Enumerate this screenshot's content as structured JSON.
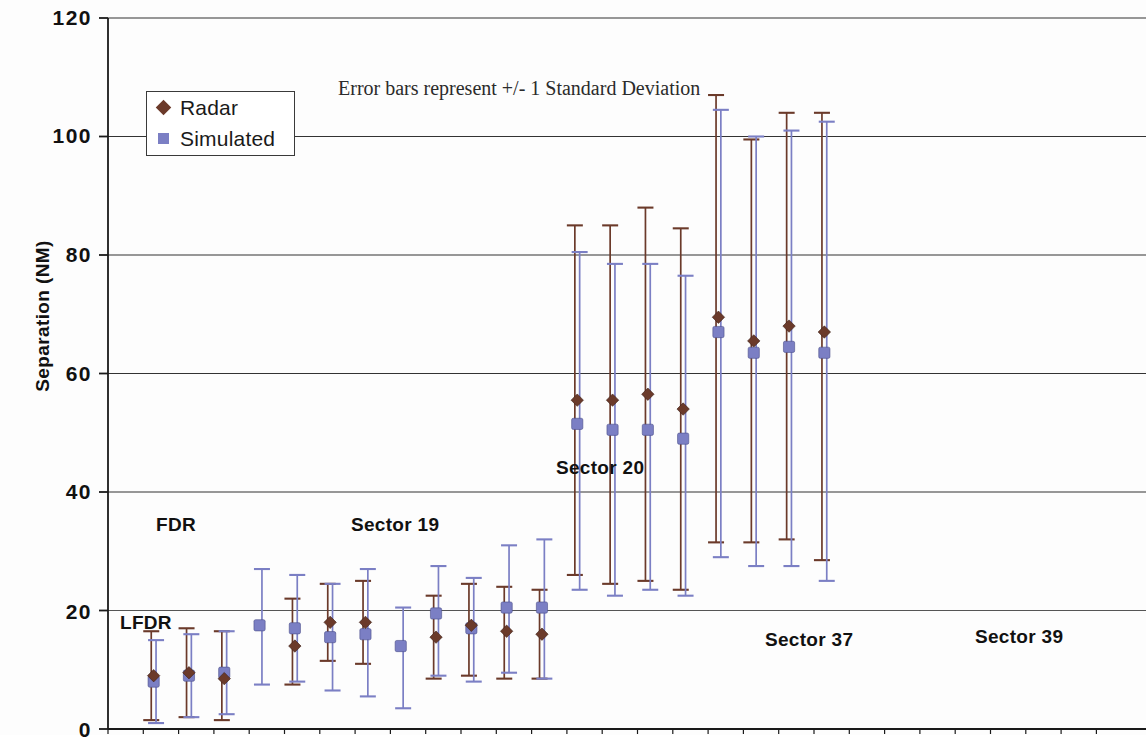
{
  "chart_data": {
    "type": "scatter",
    "title": "",
    "annotation": "Error bars represent +/- 1 Standard Deviation",
    "xlabel": "",
    "ylabel": "Separation (NM)",
    "ylim": [
      0,
      120
    ],
    "yticks": [
      0,
      20,
      40,
      60,
      80,
      100,
      120
    ],
    "grid": "horizontal",
    "legend_position": "upper-left",
    "legend": [
      {
        "name": "Radar",
        "color": "#6B3A2A",
        "marker": "diamond"
      },
      {
        "name": "Simulated",
        "color": "#7B7FC4",
        "marker": "square"
      }
    ],
    "group_labels": [
      {
        "text": "FDR",
        "x_pct": 14.5,
        "y_nm": 32
      },
      {
        "text": "LFDR",
        "x_pct": 12.5,
        "y_nm": 19
      },
      {
        "text": "Sector 19",
        "x_pct": 33.0,
        "y_nm": 32
      },
      {
        "text": "Sector 20",
        "x_pct": 53.0,
        "y_nm": 42
      },
      {
        "text": "Sector 37",
        "x_pct": 74.0,
        "y_nm": 14
      },
      {
        "text": "Sector 39",
        "x_pct": 92.0,
        "y_nm": 14
      }
    ],
    "groups": [
      {
        "name": "FDR",
        "points": [
          {
            "x": 1,
            "radar": 9.0,
            "radar_lo": 1.5,
            "radar_hi": 16.5,
            "sim": 8.0,
            "sim_lo": 1.0,
            "sim_hi": 15.0
          },
          {
            "x": 2,
            "radar": 9.5,
            "radar_lo": 2.0,
            "radar_hi": 17.0,
            "sim": 9.0,
            "sim_lo": 2.0,
            "sim_hi": 16.0
          },
          {
            "x": 3,
            "radar": 8.5,
            "radar_lo": 1.5,
            "radar_hi": 16.5,
            "sim": 9.5,
            "sim_lo": 2.5,
            "sim_hi": 16.5
          },
          {
            "x": 4,
            "radar": null,
            "radar_lo": null,
            "radar_hi": null,
            "sim": 17.5,
            "sim_lo": 7.5,
            "sim_hi": 27.0
          }
        ]
      },
      {
        "name": "Sector 19",
        "points": [
          {
            "x": 5,
            "radar": 14.0,
            "radar_lo": 7.5,
            "radar_hi": 22.0,
            "sim": 17.0,
            "sim_lo": 8.0,
            "sim_hi": 26.0
          },
          {
            "x": 6,
            "radar": 18.0,
            "radar_lo": 11.5,
            "radar_hi": 24.5,
            "sim": 15.5,
            "sim_lo": 6.5,
            "sim_hi": 24.5
          },
          {
            "x": 7,
            "radar": 18.0,
            "radar_lo": 11.0,
            "radar_hi": 25.0,
            "sim": 16.0,
            "sim_lo": 5.5,
            "sim_hi": 27.0
          },
          {
            "x": 8,
            "radar": null,
            "radar_lo": null,
            "radar_hi": null,
            "sim": 14.0,
            "sim_lo": 3.5,
            "sim_hi": 20.5
          }
        ]
      },
      {
        "name": "Sector 20",
        "points": [
          {
            "x": 9,
            "radar": 15.5,
            "radar_lo": 8.5,
            "radar_hi": 22.5,
            "sim": 19.5,
            "sim_lo": 9.0,
            "sim_hi": 27.5
          },
          {
            "x": 10,
            "radar": 17.5,
            "radar_lo": 9.0,
            "radar_hi": 24.5,
            "sim": 17.0,
            "sim_lo": 8.0,
            "sim_hi": 25.5
          },
          {
            "x": 11,
            "radar": 16.5,
            "radar_lo": 8.5,
            "radar_hi": 24.0,
            "sim": 20.5,
            "sim_lo": 9.5,
            "sim_hi": 31.0
          },
          {
            "x": 12,
            "radar": 16.0,
            "radar_lo": 8.5,
            "radar_hi": 23.5,
            "sim": 20.5,
            "sim_lo": 8.5,
            "sim_hi": 32.0
          }
        ]
      },
      {
        "name": "Sector 37",
        "points": [
          {
            "x": 13,
            "radar": 55.5,
            "radar_lo": 26.0,
            "radar_hi": 85.0,
            "sim": 51.5,
            "sim_lo": 23.5,
            "sim_hi": 80.5
          },
          {
            "x": 14,
            "radar": 55.5,
            "radar_lo": 24.5,
            "radar_hi": 85.0,
            "sim": 50.5,
            "sim_lo": 22.5,
            "sim_hi": 78.5
          },
          {
            "x": 15,
            "radar": 56.5,
            "radar_lo": 25.0,
            "radar_hi": 88.0,
            "sim": 50.5,
            "sim_lo": 23.5,
            "sim_hi": 78.5
          },
          {
            "x": 16,
            "radar": 54.0,
            "radar_lo": 23.5,
            "radar_hi": 84.5,
            "sim": 49.0,
            "sim_lo": 22.5,
            "sim_hi": 76.5
          }
        ]
      },
      {
        "name": "Sector 39",
        "points": [
          {
            "x": 17,
            "radar": 69.5,
            "radar_lo": 31.5,
            "radar_hi": 107.0,
            "sim": 67.0,
            "sim_lo": 29.0,
            "sim_hi": 104.5
          },
          {
            "x": 18,
            "radar": 65.5,
            "radar_lo": 31.5,
            "radar_hi": 99.5,
            "sim": 63.5,
            "sim_lo": 27.5,
            "sim_hi": 100.0
          },
          {
            "x": 19,
            "radar": 68.0,
            "radar_lo": 32.0,
            "radar_hi": 104.0,
            "sim": 64.5,
            "sim_lo": 27.5,
            "sim_hi": 101.0
          },
          {
            "x": 20,
            "radar": 67.0,
            "radar_lo": 28.5,
            "radar_hi": 104.0,
            "sim": 63.5,
            "sim_lo": 25.0,
            "sim_hi": 102.5
          }
        ]
      }
    ]
  },
  "axis": {
    "y_title": "Separation (NM)",
    "y_ticks": [
      "120",
      "100",
      "80",
      "60",
      "40",
      "20",
      "0"
    ]
  },
  "legend": {
    "radar_label": "Radar",
    "simulated_label": "Simulated"
  },
  "annotation": {
    "text": "Error bars represent +/- 1 Standard Deviation"
  },
  "labels": {
    "fdr": "FDR",
    "lfdr": "LFDR",
    "sector19": "Sector 19",
    "sector20": "Sector 20",
    "sector37": "Sector 37",
    "sector39": "Sector 39"
  },
  "colors": {
    "radar": "#6B3A2A",
    "simulated": "#7B7FC4",
    "axis": "#1a1a1a",
    "grid": "#333333"
  }
}
